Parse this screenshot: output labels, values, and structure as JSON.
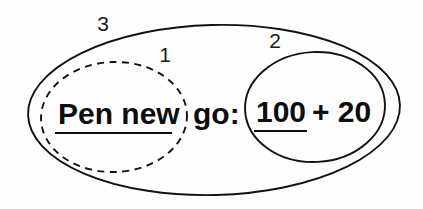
{
  "diagram": {
    "type": "nested-ellipse-annotation",
    "background_color": "#fefefe",
    "stroke_color": "#121212",
    "text_color": "#0d0d0d",
    "canvas": {
      "width": 423,
      "height": 209
    },
    "expression": {
      "full_text": "Pen new go: 100 + 20",
      "segments": [
        {
          "id": "seg-pen-new",
          "text": "Pen new",
          "underlined": true
        },
        {
          "id": "seg-go",
          "text": "go:",
          "underlined": false
        },
        {
          "id": "seg-100",
          "text": "100",
          "underlined": true
        },
        {
          "id": "seg-plus",
          "text": "+",
          "underlined": false
        },
        {
          "id": "seg-20",
          "text": "20",
          "underlined": false
        }
      ]
    },
    "regions": [
      {
        "id": "region-1",
        "label": "1",
        "style": "dashed",
        "encloses": "Pen new",
        "cx": 114,
        "cy": 117,
        "rx": 73,
        "ry": 55,
        "label_x": 165,
        "label_y": 62
      },
      {
        "id": "region-2",
        "label": "2",
        "style": "solid",
        "encloses": "100 + 20",
        "cx": 315,
        "cy": 107,
        "rx": 70,
        "ry": 55,
        "label_x": 275,
        "label_y": 48
      },
      {
        "id": "region-3",
        "label": "3",
        "style": "solid",
        "encloses": "Pen new go: 100 + 20",
        "cx": 214,
        "cy": 110,
        "rx": 186,
        "ry": 85,
        "label_x": 103,
        "label_y": 31
      }
    ],
    "text_items": [
      {
        "id": "text-pen-new",
        "value": "Pen new",
        "x": 58,
        "y": 124
      },
      {
        "id": "text-go",
        "value": "go:",
        "x": 193,
        "y": 124
      },
      {
        "id": "text-100",
        "value": "100",
        "x": 256,
        "y": 122
      },
      {
        "id": "text-plus-20",
        "value": "+ 20",
        "x": 312,
        "y": 122
      }
    ],
    "underlines": [
      {
        "id": "underline-pen-new",
        "x1": 55,
        "x2": 172,
        "y": 133
      },
      {
        "id": "underline-100",
        "x1": 254,
        "x2": 307,
        "y": 131
      }
    ]
  }
}
